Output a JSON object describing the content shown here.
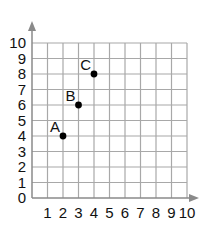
{
  "chart_data": {
    "type": "scatter",
    "title": "",
    "xlabel": "",
    "ylabel": "",
    "xlim": [
      0,
      10
    ],
    "ylim": [
      0,
      10
    ],
    "grid": true,
    "x_ticks": [
      "1",
      "2",
      "3",
      "4",
      "5",
      "6",
      "7",
      "8",
      "9",
      "10"
    ],
    "y_ticks": [
      "0",
      "1",
      "2",
      "3",
      "4",
      "5",
      "6",
      "7",
      "8",
      "9",
      "10"
    ],
    "points": [
      {
        "label": "A",
        "x": 2,
        "y": 4
      },
      {
        "label": "B",
        "x": 3,
        "y": 6
      },
      {
        "label": "C",
        "x": 4,
        "y": 8
      }
    ]
  },
  "colors": {
    "grid": "#a8a8a8",
    "axis": "#8a8a8a",
    "point": "#000000",
    "text": "#111111"
  }
}
